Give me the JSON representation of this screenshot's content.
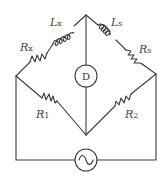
{
  "diagram": {
    "type": "AC bridge circuit (Maxwell / inductance bridge)",
    "components": {
      "Lx": {
        "label": "L",
        "sub": "x",
        "kind": "inductor",
        "branch": "top-left upper"
      },
      "Ls": {
        "label": "L",
        "sub": "s",
        "kind": "inductor",
        "branch": "top-right upper"
      },
      "Rx": {
        "label": "R",
        "sub": "x",
        "kind": "resistor",
        "branch": "top-left lower"
      },
      "Rs": {
        "label": "R",
        "sub": "s",
        "kind": "resistor",
        "branch": "top-right lower"
      },
      "R1": {
        "label": "R",
        "sub": "1",
        "kind": "resistor",
        "branch": "bottom-left"
      },
      "R2": {
        "label": "R",
        "sub": "2",
        "kind": "resistor",
        "branch": "bottom-right"
      },
      "D": {
        "label": "D",
        "kind": "detector"
      },
      "source": {
        "label": "~",
        "kind": "AC source"
      }
    },
    "colors": {
      "stroke": "#3a3a3a",
      "text": "#444444",
      "background": "#ffffff"
    }
  }
}
